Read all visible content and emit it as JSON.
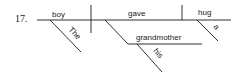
{
  "diagram": {
    "type": "sentence-diagram",
    "item_number": "17.",
    "sentence_words": {
      "subject": "boy",
      "subject_modifier": "The",
      "verb": "gave",
      "indirect_object": "grandmother",
      "indirect_object_modifier": "his",
      "direct_object": "hug",
      "direct_object_modifier": "a"
    },
    "line_color": "#1a1a1a"
  }
}
